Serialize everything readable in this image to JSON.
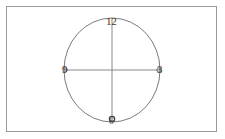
{
  "figure": {
    "kind": "clock-face-diagram",
    "background_color": "#ffffff",
    "frame": {
      "border_color": "#9a9a9a",
      "fill_color": "#ffffff"
    },
    "circle": {
      "stroke_color": "#6b6b6b",
      "center_x": 112,
      "center_y": 70,
      "radius_x": 48,
      "radius_y": 52
    },
    "axes": {
      "stroke_color": "#7a7a7a",
      "vertical": {
        "x": 112,
        "y_top": 18,
        "y_bottom": 122
      },
      "horizontal": {
        "y": 70,
        "x_left": 64,
        "x_right": 160
      }
    },
    "markers": [
      {
        "name": "marker-9",
        "cx": 65,
        "cy": 70,
        "r": 2.2,
        "stroke_color": "#5a5a5a"
      },
      {
        "name": "marker-3",
        "cx": 159,
        "cy": 70,
        "r": 2.2,
        "stroke_color": "#5a5a5a"
      },
      {
        "name": "marker-6",
        "cx": 112,
        "cy": 119,
        "r": 2.6,
        "stroke_color": "#3a3a3a"
      }
    ],
    "labels": {
      "top": "12",
      "right": "3",
      "left": "9",
      "bottom": "6"
    }
  }
}
